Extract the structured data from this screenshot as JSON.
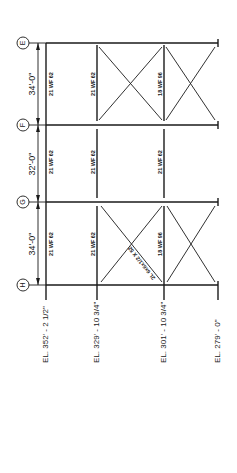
{
  "drawing": {
    "title": "Braced frame elevation",
    "orientation": "rotated 90 degrees counter-clockwise",
    "grid_lines": [
      {
        "label": "E",
        "y": 43
      },
      {
        "label": "F",
        "y": 125
      },
      {
        "label": "G",
        "y": 202
      },
      {
        "label": "H",
        "y": 285
      }
    ],
    "bay_dimensions": [
      {
        "text": "34'-0\"",
        "between": [
          "E",
          "F"
        ]
      },
      {
        "text": "32'-0\"",
        "between": [
          "F",
          "G"
        ]
      },
      {
        "text": "34'-0\"",
        "between": [
          "G",
          "H"
        ]
      }
    ],
    "elevations": [
      {
        "text": "EL. 352' - 2 1/2\"",
        "x": 46
      },
      {
        "text": "EL. 329' - 10 3/4\"",
        "x": 97
      },
      {
        "text": "EL. 301' - 10 3/4\"",
        "x": 164
      },
      {
        "text": "EL. 279' - 0\"",
        "x": 218
      }
    ],
    "members": {
      "bay_EF": [
        "21 WF 62",
        "21 WF 62",
        "18 WF 96"
      ],
      "bay_FG": [
        "21 WF 62",
        "21 WF 62",
        "21 WF 62"
      ],
      "bay_GH": [
        "21 WF 62",
        "21 WF 62",
        "18 WF 96"
      ]
    },
    "brace_label": "2L 6x6x1/2 X 52",
    "colors": {
      "line": "#1a1a1a",
      "background": "#ffffff"
    }
  }
}
